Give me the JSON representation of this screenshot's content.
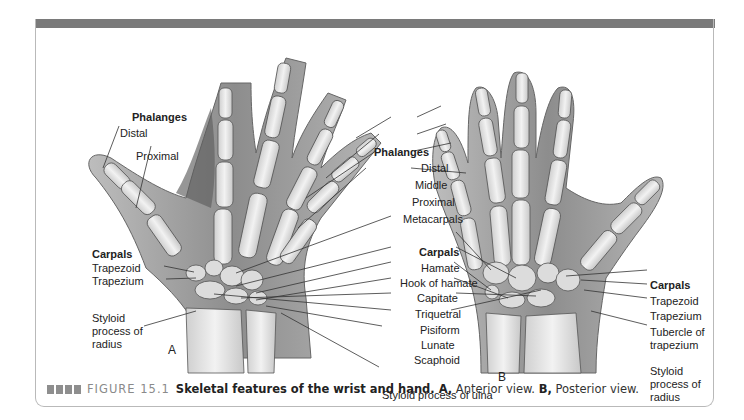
{
  "figure": {
    "number_label": "FIGURE 15.1",
    "title": "Skeletal features of the wrist and hand.",
    "caption_parts": {
      "a_letter": "A,",
      "a_text": " Anterior view. ",
      "b_letter": "B,",
      "b_text": " Posterior view."
    },
    "colors": {
      "top_bar": "#7a7a7a",
      "frame_border": "#b9b9b9",
      "skin": "#9a9a9a",
      "bone": "#e6e6e6"
    }
  },
  "panel_a": {
    "letter": "A",
    "phalanges_heading": "Phalanges",
    "phalanges": [
      "Distal",
      "Proximal"
    ],
    "carpals_heading": "Carpals",
    "carpals": [
      "Trapezoid",
      "Trapezium"
    ],
    "styloid_radius": [
      "Styloid",
      "process of",
      "radius"
    ]
  },
  "center_labels": {
    "phalanges_heading": "Phalanges",
    "phalanges": [
      "Distal",
      "Middle",
      "Proximal"
    ],
    "metacarpals": "Metacarpals",
    "carpals_heading": "Carpals",
    "carpals": [
      "Hamate",
      "Hook of hamate",
      "Capitate",
      "Triquetral",
      "Pisiform",
      "Lunate",
      "Scaphoid"
    ],
    "styloid_ulna": "Styloid process of ulna"
  },
  "panel_b": {
    "letter": "B",
    "carpals_heading": "Carpals",
    "carpals": [
      "Trapezoid",
      "Trapezium"
    ],
    "tubercle": [
      "Tubercle of",
      "trapezium"
    ],
    "styloid_radius": [
      "Styloid",
      "process of",
      "radius"
    ]
  }
}
